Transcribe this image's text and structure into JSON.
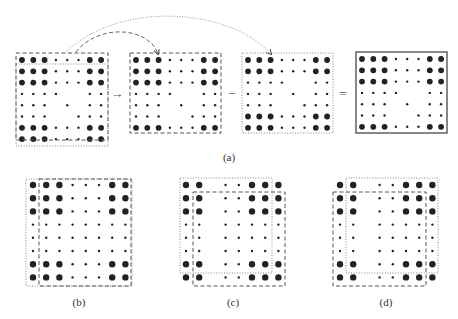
{
  "figure": {
    "panels": {
      "a": {
        "label": "(a)",
        "label_pos": [
          229,
          151
        ]
      },
      "b": {
        "label": "(b)",
        "label_pos": [
          79,
          296
        ]
      },
      "c": {
        "label": "(c)",
        "label_pos": [
          233,
          296
        ]
      },
      "d": {
        "label": "(d)",
        "label_pos": [
          386,
          296
        ]
      }
    },
    "operators": [
      {
        "symbol": "→",
        "name": "arrow-operator",
        "pos": [
          117,
          93
        ]
      },
      {
        "symbol": "−",
        "name": "minus-operator",
        "pos": [
          232,
          93
        ]
      },
      {
        "symbol": "=",
        "name": "equals-operator",
        "pos": [
          343,
          93
        ]
      }
    ],
    "colors": {
      "dot": "#222222",
      "frame": "#555555",
      "background": "#ffffff"
    },
    "grids": [
      {
        "id": "a1",
        "origin": [
          22,
          60
        ],
        "pitch": 11.3,
        "rows": [
          "LLLsssLL",
          "LLLsssLL",
          "LLLsssLL",
          "ssss..ss",
          "sss.s.ss",
          "sss..sss",
          "LLLsssLL",
          "LLLsssLL"
        ],
        "boxes": [
          {
            "style": "dashed",
            "rect": [
              16,
              53,
              92,
              87
            ]
          },
          {
            "style": "dotted",
            "rect": [
              16,
              64,
              92,
              82
            ]
          }
        ]
      },
      {
        "id": "a2",
        "origin": [
          136,
          60
        ],
        "pitch": 11.3,
        "rows": [
          "LLLsssLL",
          "LLLsssLL",
          "LLLsssLL",
          "ssss..ss",
          "sss.s.ss",
          "sss..sss",
          "LLLsssLL"
        ],
        "boxes": [
          {
            "style": "dashed",
            "rect": [
              130,
              53,
              91,
              80
            ]
          }
        ]
      },
      {
        "id": "a3",
        "origin": [
          248,
          60
        ],
        "pitch": 11.3,
        "rows": [
          "LLLsssLL",
          "LLLsssLL",
          "ssss..ss",
          "sss.s.ss",
          "sss..sss",
          "LLLsssLL",
          "LLLsssLL"
        ],
        "boxes": [
          {
            "style": "dotted",
            "rect": [
              242,
              53,
              91,
              80
            ]
          }
        ]
      },
      {
        "id": "a4",
        "origin": [
          362,
          59
        ],
        "pitch": 11.3,
        "rows": [
          "LLLsssLL",
          "LLLsssLL",
          "LLLsssLL",
          "ssss..ss",
          "sss.s.ss",
          "sss..sss",
          "LLLsssLL"
        ],
        "boxes": [
          {
            "style": "solid",
            "rect": [
              356,
              52,
              91,
              81
            ]
          }
        ]
      },
      {
        "id": "b",
        "origin": [
          33,
          185
        ],
        "pitch": 13.2,
        "rows": [
          "LLLsssLL",
          "LLLsssLL",
          "LLLsssLL",
          "ssssssss",
          "ssssssss",
          "ssssssss",
          "LLLsssLL",
          "LLLsssLL"
        ],
        "boxes": [
          {
            "style": "dotted",
            "rect": [
              26,
              179,
              106,
              107
            ]
          },
          {
            "style": "dashed",
            "rect": [
              39,
              179,
              92,
              107
            ]
          }
        ]
      },
      {
        "id": "c",
        "origin": [
          186,
          185
        ],
        "pitch": 13.2,
        "rows": [
          "LL.ssLLL",
          "LL.ssLLL",
          "LL.ssLLL",
          "ss.sssss",
          "ss.sssss",
          "ss.sssss",
          "LL.ssLLL",
          "LL.ssLLL"
        ],
        "boxes": [
          {
            "style": "dotted",
            "rect": [
              180,
              178,
              92,
              95
            ]
          },
          {
            "style": "dashed",
            "rect": [
              193,
              192,
              92,
              94
            ]
          }
        ]
      },
      {
        "id": "d",
        "origin": [
          340,
          185
        ],
        "pitch": 13.2,
        "rows": [
          "LL.ssLLL",
          "LL.ssLLL",
          "LL.ssLLL",
          "ss.sssss",
          "ss.sssss",
          "ss.sssss",
          "LL.ssLLL",
          "LL.ssLLL"
        ],
        "boxes": [
          {
            "style": "dotted",
            "rect": [
              346,
              178,
              92,
              95
            ]
          },
          {
            "style": "dashed",
            "rect": [
              333,
              192,
              93,
              94
            ]
          }
        ]
      }
    ],
    "curves": [
      {
        "name": "dashed-curve-arrow",
        "style": "dashed",
        "path": "M 76 52 C 100 22, 150 28, 158 54"
      },
      {
        "name": "dotted-curve-arrow",
        "style": "dotted",
        "path": "M 66 52 C 120 0, 230 8, 271 54"
      }
    ]
  }
}
